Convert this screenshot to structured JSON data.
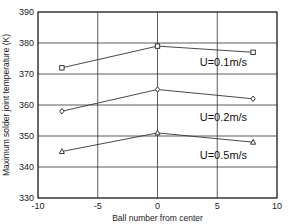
{
  "chart_data": {
    "type": "line",
    "title": "",
    "xlabel": "Ball number from center",
    "ylabel": "Maximum solder joint temperature (K)",
    "xlim": [
      -10,
      10
    ],
    "ylim": [
      330,
      390
    ],
    "x_ticks": [
      -10,
      -5,
      0,
      5,
      10
    ],
    "y_ticks": [
      330,
      340,
      350,
      360,
      370,
      380,
      390
    ],
    "grid": true,
    "legend_position": "inline labels near right end of each series",
    "x": [
      -8,
      0,
      8
    ],
    "series": [
      {
        "name": "U=0.1m/s",
        "marker": "square",
        "values": [
          372,
          379,
          377
        ]
      },
      {
        "name": "U=0.2m/s",
        "marker": "diamond",
        "values": [
          358,
          365,
          362
        ]
      },
      {
        "name": "U=0.5m/s",
        "marker": "triangle",
        "values": [
          345,
          351,
          348
        ]
      }
    ],
    "series_labels": [
      {
        "text": "U=0.1m/s",
        "x": 7.5,
        "y": 372.5
      },
      {
        "text": "U=0.2m/s",
        "x": 7.5,
        "y": 355
      },
      {
        "text": "U=0.5m/s",
        "x": 7.5,
        "y": 342.5
      }
    ]
  },
  "layout": {
    "plot_left": 38,
    "plot_right": 277,
    "plot_top": 12,
    "plot_bottom": 198
  }
}
